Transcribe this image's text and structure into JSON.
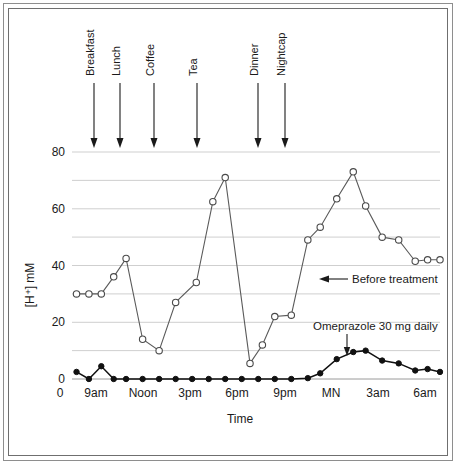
{
  "figure": {
    "title": "",
    "y_axis_label": "[H⁺] mM",
    "x_axis_label": "Time"
  },
  "chart_data": {
    "type": "line",
    "title": "",
    "subtitle": "",
    "xlabel": "Time",
    "ylabel": "[H⁺] mM",
    "ylim": [
      0,
      80
    ],
    "y_ticks": [
      0,
      20,
      40,
      60,
      80
    ],
    "y_tick_labels": [
      "0",
      "20",
      "40",
      "60",
      "80"
    ],
    "y_gridlines": [
      0,
      10,
      20,
      30,
      40,
      50,
      60,
      70,
      80
    ],
    "grid": true,
    "legend_position": "inline-annotation",
    "x_ticks": [
      0,
      1,
      2,
      3,
      4,
      5,
      6,
      7,
      8,
      9,
      10
    ],
    "x_tick_labels": [
      "0",
      "9am",
      "",
      "Noon",
      "",
      "3pm",
      "",
      "6pm",
      "",
      "9pm",
      "",
      "MN",
      "",
      "3am",
      "",
      "6am"
    ],
    "x_tick_labels_shown": [
      "0",
      "9am",
      "Noon",
      "3pm",
      "6pm",
      "9pm",
      "MN",
      "3am",
      "6am"
    ],
    "x_hours_axis": [
      "8am",
      "9am",
      "10am",
      "11am",
      "Noon",
      "1pm",
      "2pm",
      "3pm",
      "4pm",
      "5pm",
      "6pm",
      "7pm",
      "8pm",
      "9pm",
      "10pm",
      "11pm",
      "MN",
      "1am",
      "2am",
      "3am",
      "4am",
      "5am",
      "6am",
      "7am"
    ],
    "series": [
      {
        "name": "Before treatment",
        "marker": "open-circle",
        "color": "#4a4a4a",
        "x": [
          9,
          9.75,
          10.5,
          11.25,
          12,
          13,
          14,
          15,
          16.25,
          17.25,
          18,
          19.5,
          20.25,
          21,
          22,
          23,
          23.75,
          24.75,
          25.75,
          26.5,
          27.5,
          28.5,
          29.5,
          30.25,
          31
        ],
        "x_labels": [
          "9am",
          "9:45am",
          "10:30am",
          "11:15am",
          "Noon",
          "1pm",
          "2pm",
          "3pm",
          "4pm",
          "5pm",
          "6pm",
          "7:30pm",
          "8:15pm",
          "9pm",
          "10pm",
          "11pm",
          "MN",
          "1am",
          "2am",
          "3am",
          "4am",
          "5am",
          "6am",
          "6:45am",
          "7am"
        ],
        "values": [
          30,
          30,
          30,
          36,
          42.5,
          14,
          10,
          27,
          34,
          62.5,
          71,
          5.5,
          12,
          22,
          22.5,
          49,
          53.5,
          63.5,
          73,
          61,
          50,
          49,
          41.5,
          42,
          42
        ]
      },
      {
        "name": "Omeprazole 30 mg daily",
        "marker": "filled-circle",
        "color": "#111111",
        "x": [
          9,
          9.75,
          10.5,
          11.25,
          12,
          13,
          14,
          15,
          16,
          17,
          18,
          19,
          20,
          21,
          22,
          23,
          23.75,
          24.75,
          25.75,
          26.5,
          27.5,
          28.5,
          29.5,
          30.25,
          31
        ],
        "values": [
          2.5,
          0,
          4.5,
          0,
          0,
          0,
          0,
          0,
          0,
          0,
          0,
          0,
          0,
          0,
          0,
          0.3,
          2,
          7,
          9.5,
          10,
          6.5,
          5.5,
          3,
          3.5,
          2.5
        ]
      }
    ],
    "annotations": [
      {
        "name": "before-treatment",
        "text": "Before treatment",
        "arrow": "left"
      },
      {
        "name": "omeprazole",
        "text": "Omeprazole 30 mg daily",
        "arrow": "down"
      }
    ],
    "event_markers": [
      {
        "label": "Breakfast",
        "x_time": "8:30am"
      },
      {
        "label": "Lunch",
        "x_time": "12:00pm"
      },
      {
        "label": "Coffee",
        "x_time": "2:00pm"
      },
      {
        "label": "Tea",
        "x_time": "4:30pm"
      },
      {
        "label": "Dinner",
        "x_time": "8:00pm"
      },
      {
        "label": "Nightcap",
        "x_time": "10:00pm"
      }
    ]
  },
  "colors": {
    "gridline": "#c9c9c9",
    "open_series": "#4a4a4a",
    "filled_series": "#111111",
    "text": "#1a1a1a",
    "frame": "#8e8e8e",
    "background": "#ffffff"
  },
  "labels": {
    "y_tick_0": "0",
    "y_tick_20": "20",
    "y_tick_40": "40",
    "y_tick_60": "60",
    "y_tick_80": "80",
    "x_tick_0": "0",
    "x_tick_9am": "9am",
    "x_tick_noon": "Noon",
    "x_tick_3pm": "3pm",
    "x_tick_6pm": "6pm",
    "x_tick_9pm": "9pm",
    "x_tick_mn": "MN",
    "x_tick_3am": "3am",
    "x_tick_6am": "6am",
    "event_breakfast": "Breakfast",
    "event_lunch": "Lunch",
    "event_coffee": "Coffee",
    "event_tea": "Tea",
    "event_dinner": "Dinner",
    "event_nightcap": "Nightcap",
    "annot_before": "Before treatment",
    "annot_omeprazole": "Omeprazole 30 mg daily",
    "axis_y": "[H⁺] mM",
    "axis_x": "Time"
  }
}
